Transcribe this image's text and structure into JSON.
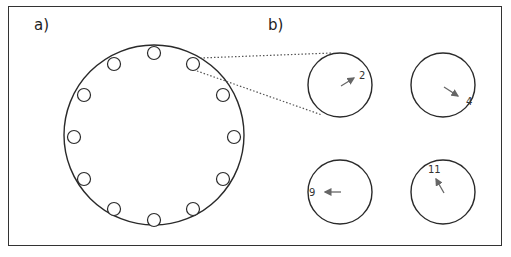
{
  "panels": {
    "a": {
      "label": "a)"
    },
    "b": {
      "label": "b)"
    }
  },
  "colors": {
    "stroke": "#2a2a2a",
    "arrow": "#666666",
    "dotted": "#555555",
    "frame": "#333333"
  },
  "diagram_a": {
    "description": "Large circle with 12 small circles evenly spaced around its rim (clock positions)",
    "small_circle_count": 12,
    "highlighted_position": 1
  },
  "diagram_b": {
    "clocks": [
      {
        "number": "2",
        "direction": "pointing to 2 o'clock"
      },
      {
        "number": "4",
        "direction": "pointing to 4 o'clock"
      },
      {
        "number": "9",
        "direction": "pointing to 9 o'clock"
      },
      {
        "number": "11",
        "direction": "pointing to 11 o'clock"
      }
    ]
  }
}
